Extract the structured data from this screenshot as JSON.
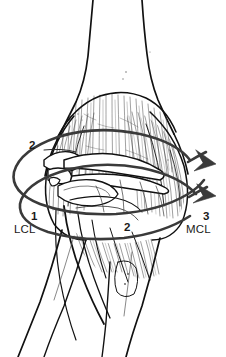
{
  "figure": {
    "background_color": "#ffffff",
    "ink_color": "#111111",
    "arrow_color": "#3a3a3a",
    "hatch_color": "#5a5a5a",
    "width": 226,
    "height": 357
  },
  "labels": {
    "lcl_number": "1",
    "lcl_abbr": "LCL",
    "capsule_number_upper": "2",
    "capsule_number_lower": "2",
    "mcl_number": "3",
    "mcl_abbr": "MCL"
  },
  "annotations": {
    "rotation_arrow_upper": "rotation-arrow-upper",
    "rotation_arrow_lower": "rotation-arrow-lower"
  },
  "structures": {
    "humerus": "humerus-shaft",
    "radius": "radius-shaft",
    "ulna": "ulna-shaft",
    "joint": "elbow-joint-detail"
  }
}
